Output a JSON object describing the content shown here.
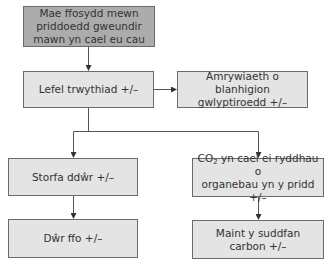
{
  "diagram": {
    "type": "flowchart",
    "colors": {
      "root_fill": "#acacac",
      "node_fill": "#e4e4e4",
      "border": "#6b6b6b",
      "line": "#555555"
    },
    "nodes": {
      "root": {
        "lines": [
          "Mae ffosydd mewn",
          "priddoedd gweundir",
          "mawn yn cael eu cau"
        ]
      },
      "water_table": {
        "label": "Lefel trwythiad +/–"
      },
      "plant_diversity": {
        "lines": [
          "Amrywiaeth o blanhigion",
          "gwlyptiroedd +/–"
        ]
      },
      "water_storage": {
        "label": "Storfa ddŵr +/–"
      },
      "co2_release": {
        "prefix": "CO",
        "sub": "2",
        "line1_rest": " yn cael ei ryddhau o",
        "line2": "organebau yn y pridd +/–"
      },
      "runoff": {
        "label": "Dŵr ffo +/–"
      },
      "carbon_sink": {
        "label": "Maint y suddfan carbon +/–"
      }
    },
    "edges": [
      [
        "root",
        "water_table"
      ],
      [
        "water_table",
        "plant_diversity"
      ],
      [
        "water_table",
        "water_storage"
      ],
      [
        "water_table",
        "co2_release"
      ],
      [
        "water_storage",
        "runoff"
      ],
      [
        "co2_release",
        "carbon_sink"
      ]
    ]
  }
}
